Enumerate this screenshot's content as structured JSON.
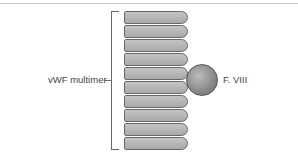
{
  "diagram": {
    "labels": {
      "multimer": "vWF multimer",
      "factor": "F. VIII"
    },
    "subunit_count": 10,
    "colors": {
      "subunit_fill": "#b5b5b5",
      "subunit_outline": "#666666",
      "factor_fill": "#8c8c8c",
      "line": "#6a6a6a"
    }
  }
}
